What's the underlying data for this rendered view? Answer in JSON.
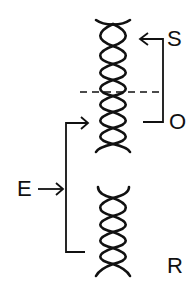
{
  "diagram": {
    "type": "dna-helix-schematic",
    "labels": {
      "S": "S",
      "O": "O",
      "E": "E",
      "R": "R"
    },
    "colors": {
      "stroke": "#111111",
      "background": "#ffffff"
    },
    "elements": {
      "top_helix": {
        "x_center": 113,
        "y_start": 20,
        "y_end": 150,
        "crossings": 8
      },
      "bottom_helix": {
        "x_center": 113,
        "y_start": 187,
        "y_end": 276,
        "crossings": 5
      },
      "dashed_divider": {
        "y": 92
      },
      "s_bracket": {
        "arrow_to": "top_helix",
        "label": "S"
      },
      "o_bracket": {
        "label": "O"
      },
      "e_bracket": {
        "label": "E",
        "arrow_to": "top_helix"
      }
    }
  }
}
